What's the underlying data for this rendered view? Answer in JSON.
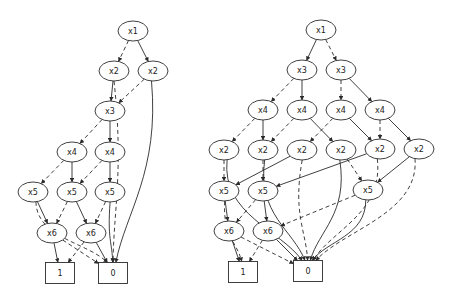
{
  "diagram": {
    "type": "binary-decision-diagrams",
    "legend_implicit": {
      "solid": "high (1) edge",
      "dashed": "low (0) edge"
    },
    "graphs": [
      {
        "name": "left-bdd",
        "nodes": [
          {
            "id": "L_x1",
            "label": "x1",
            "shape": "ellipse",
            "x": 133,
            "y": 31
          },
          {
            "id": "L_x2a",
            "label": "x2",
            "shape": "ellipse",
            "x": 114,
            "y": 71
          },
          {
            "id": "L_x2b",
            "label": "x2",
            "shape": "ellipse",
            "x": 153,
            "y": 71
          },
          {
            "id": "L_x3",
            "label": "x3",
            "shape": "ellipse",
            "x": 110,
            "y": 111
          },
          {
            "id": "L_x4a",
            "label": "x4",
            "shape": "ellipse",
            "x": 72,
            "y": 152
          },
          {
            "id": "L_x4b",
            "label": "x4",
            "shape": "ellipse",
            "x": 110,
            "y": 152
          },
          {
            "id": "L_x5a",
            "label": "x5",
            "shape": "ellipse",
            "x": 33,
            "y": 192
          },
          {
            "id": "L_x5b",
            "label": "x5",
            "shape": "ellipse",
            "x": 72,
            "y": 192
          },
          {
            "id": "L_x5c",
            "label": "x5",
            "shape": "ellipse",
            "x": 110,
            "y": 192
          },
          {
            "id": "L_x6a",
            "label": "x6",
            "shape": "ellipse",
            "x": 52,
            "y": 233
          },
          {
            "id": "L_x6b",
            "label": "x6",
            "shape": "ellipse",
            "x": 91,
            "y": 233
          },
          {
            "id": "L_t1",
            "label": "1",
            "shape": "box",
            "x": 60,
            "y": 273
          },
          {
            "id": "L_t0",
            "label": "0",
            "shape": "box",
            "x": 113,
            "y": 273
          }
        ],
        "edges": [
          {
            "from": "L_x1",
            "to": "L_x2a",
            "style": "dashed"
          },
          {
            "from": "L_x1",
            "to": "L_x2b",
            "style": "solid"
          },
          {
            "from": "L_x2a",
            "to": "L_x3",
            "style": "solid"
          },
          {
            "from": "L_x2a",
            "to": "L_t0",
            "style": "dashed"
          },
          {
            "from": "L_x2b",
            "to": "L_x3",
            "style": "dashed"
          },
          {
            "from": "L_x2b",
            "to": "L_t0",
            "style": "solid"
          },
          {
            "from": "L_x3",
            "to": "L_x4a",
            "style": "dashed"
          },
          {
            "from": "L_x3",
            "to": "L_x4b",
            "style": "solid"
          },
          {
            "from": "L_x4a",
            "to": "L_x5a",
            "style": "dashed"
          },
          {
            "from": "L_x4a",
            "to": "L_x5b",
            "style": "solid"
          },
          {
            "from": "L_x4b",
            "to": "L_x5b",
            "style": "dashed"
          },
          {
            "from": "L_x4b",
            "to": "L_x5c",
            "style": "solid"
          },
          {
            "from": "L_x5a",
            "to": "L_x6a",
            "style": "solid"
          },
          {
            "from": "L_x5a",
            "to": "L_t0",
            "style": "dashed"
          },
          {
            "from": "L_x5b",
            "to": "L_x6a",
            "style": "dashed"
          },
          {
            "from": "L_x5b",
            "to": "L_x6b",
            "style": "solid"
          },
          {
            "from": "L_x5c",
            "to": "L_x6b",
            "style": "dashed"
          },
          {
            "from": "L_x5c",
            "to": "L_t0",
            "style": "solid"
          },
          {
            "from": "L_x6a",
            "to": "L_t1",
            "style": "solid"
          },
          {
            "from": "L_x6a",
            "to": "L_t0",
            "style": "dashed"
          },
          {
            "from": "L_x6b",
            "to": "L_t1",
            "style": "dashed"
          },
          {
            "from": "L_x6b",
            "to": "L_t0",
            "style": "solid"
          }
        ]
      },
      {
        "name": "right-bdd",
        "nodes": [
          {
            "id": "R_x1",
            "label": "x1",
            "shape": "ellipse",
            "x": 321,
            "y": 30
          },
          {
            "id": "R_x3a",
            "label": "x3",
            "shape": "ellipse",
            "x": 302,
            "y": 70
          },
          {
            "id": "R_x3b",
            "label": "x3",
            "shape": "ellipse",
            "x": 341,
            "y": 70
          },
          {
            "id": "R_x4a",
            "label": "x4",
            "shape": "ellipse",
            "x": 263,
            "y": 110
          },
          {
            "id": "R_x4b",
            "label": "x4",
            "shape": "ellipse",
            "x": 302,
            "y": 110
          },
          {
            "id": "R_x4c",
            "label": "x4",
            "shape": "ellipse",
            "x": 341,
            "y": 110
          },
          {
            "id": "R_x4d",
            "label": "x4",
            "shape": "ellipse",
            "x": 380,
            "y": 110
          },
          {
            "id": "R_x2a",
            "label": "x2",
            "shape": "ellipse",
            "x": 224,
            "y": 150
          },
          {
            "id": "R_x2b",
            "label": "x2",
            "shape": "ellipse",
            "x": 263,
            "y": 150
          },
          {
            "id": "R_x2c",
            "label": "x2",
            "shape": "ellipse",
            "x": 302,
            "y": 150
          },
          {
            "id": "R_x2d",
            "label": "x2",
            "shape": "ellipse",
            "x": 341,
            "y": 150
          },
          {
            "id": "R_x2e",
            "label": "x2",
            "shape": "ellipse",
            "x": 380,
            "y": 149
          },
          {
            "id": "R_x2f",
            "label": "x2",
            "shape": "ellipse",
            "x": 419,
            "y": 149
          },
          {
            "id": "R_x5a",
            "label": "x5",
            "shape": "ellipse",
            "x": 224,
            "y": 191
          },
          {
            "id": "R_x5b",
            "label": "x5",
            "shape": "ellipse",
            "x": 263,
            "y": 191
          },
          {
            "id": "R_x5c",
            "label": "x5",
            "shape": "ellipse",
            "x": 368,
            "y": 190
          },
          {
            "id": "R_x6a",
            "label": "x6",
            "shape": "ellipse",
            "x": 229,
            "y": 231
          },
          {
            "id": "R_x6b",
            "label": "x6",
            "shape": "ellipse",
            "x": 268,
            "y": 231
          },
          {
            "id": "R_t1",
            "label": "1",
            "shape": "box",
            "x": 243,
            "y": 272
          },
          {
            "id": "R_t0",
            "label": "0",
            "shape": "box",
            "x": 308,
            "y": 271
          }
        ],
        "edges": [
          {
            "from": "R_x1",
            "to": "R_x3a",
            "style": "solid"
          },
          {
            "from": "R_x1",
            "to": "R_x3b",
            "style": "dashed"
          },
          {
            "from": "R_x3a",
            "to": "R_x4a",
            "style": "dashed"
          },
          {
            "from": "R_x3a",
            "to": "R_x4b",
            "style": "solid"
          },
          {
            "from": "R_x3b",
            "to": "R_x4c",
            "style": "dashed"
          },
          {
            "from": "R_x3b",
            "to": "R_x4d",
            "style": "solid"
          },
          {
            "from": "R_x4a",
            "to": "R_x2a",
            "style": "dashed"
          },
          {
            "from": "R_x4a",
            "to": "R_x2b",
            "style": "solid"
          },
          {
            "from": "R_x4b",
            "to": "R_x2b",
            "style": "dashed"
          },
          {
            "from": "R_x4b",
            "to": "R_x2d",
            "style": "solid"
          },
          {
            "from": "R_x4c",
            "to": "R_x2c",
            "style": "dashed"
          },
          {
            "from": "R_x4c",
            "to": "R_x2e",
            "style": "solid"
          },
          {
            "from": "R_x4d",
            "to": "R_x2e",
            "style": "dashed"
          },
          {
            "from": "R_x4d",
            "to": "R_x2f",
            "style": "solid"
          },
          {
            "from": "R_x2a",
            "to": "R_x5a",
            "style": "dashed"
          },
          {
            "from": "R_x2a",
            "to": "R_t0",
            "style": "solid"
          },
          {
            "from": "R_x2b",
            "to": "R_x5b",
            "style": "dashed"
          },
          {
            "from": "R_x2b",
            "to": "R_t0",
            "style": "solid"
          },
          {
            "from": "R_x2c",
            "to": "R_x5a",
            "style": "solid"
          },
          {
            "from": "R_x2c",
            "to": "R_t0",
            "style": "dashed"
          },
          {
            "from": "R_x2d",
            "to": "R_t0",
            "style": "solid"
          },
          {
            "from": "R_x2d",
            "to": "R_x5c",
            "style": "dashed"
          },
          {
            "from": "R_x2e",
            "to": "R_x5b",
            "style": "solid"
          },
          {
            "from": "R_x2e",
            "to": "R_t0",
            "style": "dashed"
          },
          {
            "from": "R_x2f",
            "to": "R_x5c",
            "style": "solid"
          },
          {
            "from": "R_x2f",
            "to": "R_t0",
            "style": "dashed"
          },
          {
            "from": "R_x5a",
            "to": "R_x6a",
            "style": "solid"
          },
          {
            "from": "R_x5a",
            "to": "R_t1",
            "style": "dashed"
          },
          {
            "from": "R_x5b",
            "to": "R_x6a",
            "style": "dashed"
          },
          {
            "from": "R_x5b",
            "to": "R_x6b",
            "style": "solid"
          },
          {
            "from": "R_x5c",
            "to": "R_x6b",
            "style": "dashed"
          },
          {
            "from": "R_x5c",
            "to": "R_t0",
            "style": "solid"
          },
          {
            "from": "R_x6a",
            "to": "R_t1",
            "style": "solid"
          },
          {
            "from": "R_x6a",
            "to": "R_t0",
            "style": "dashed"
          },
          {
            "from": "R_x6b",
            "to": "R_t1",
            "style": "dashed"
          },
          {
            "from": "R_x6b",
            "to": "R_t0",
            "style": "solid"
          }
        ]
      }
    ],
    "style": {
      "ellipse_rx": 15,
      "ellipse_ry": 10,
      "box_w": 29,
      "box_h": 21,
      "stroke": "#2a2a2a",
      "background": "#ffffff"
    }
  }
}
